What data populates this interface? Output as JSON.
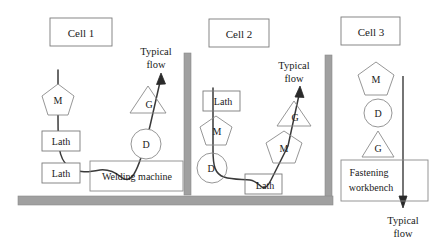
{
  "figure": {
    "type": "manufacturing-cell-layout-diagram",
    "walls": [
      {
        "name": "partition-wall-1",
        "orientation": "vertical",
        "x": 184,
        "y": 53,
        "w": 7,
        "h": 142
      },
      {
        "name": "partition-wall-2",
        "orientation": "vertical",
        "x": 325,
        "y": 55,
        "w": 7,
        "h": 145
      },
      {
        "name": "floor-wall",
        "orientation": "horizontal",
        "x": 18,
        "y": 196,
        "w": 315,
        "h": 9
      }
    ],
    "wall_color": "#9d9d9d",
    "line_color": "#3a3a3a",
    "box_border_color": "#7a7a7a"
  },
  "cells": [
    {
      "id": "cell-1",
      "label": "Cell 1",
      "label_box": {
        "x": 50,
        "y": 18,
        "w": 62,
        "h": 28
      },
      "flow_label": "Typical\nflow",
      "flow_label_lines": [
        "Typical",
        "flow"
      ],
      "machines": [
        {
          "name": "lath-1",
          "shape": "rect",
          "label": "Lath",
          "x": 42,
          "y": 131,
          "w": 38,
          "h": 20
        },
        {
          "name": "lath-2",
          "shape": "rect",
          "label": "Lath",
          "x": 42,
          "y": 163,
          "w": 38,
          "h": 20
        },
        {
          "name": "welding-machine",
          "shape": "rect",
          "label": "Welding machine",
          "x": 90,
          "y": 161,
          "w": 93,
          "h": 30
        },
        {
          "name": "mill-m",
          "shape": "pentagon",
          "label": "M",
          "cx": 58,
          "cy": 100,
          "r": 16
        },
        {
          "name": "drill-d",
          "shape": "circle",
          "label": "D",
          "cx": 146,
          "cy": 144,
          "r": 15
        },
        {
          "name": "grinder-g",
          "shape": "triangle",
          "label": "G",
          "cx": 148,
          "cy": 100,
          "r": 18
        }
      ]
    },
    {
      "id": "cell-2",
      "label": "Cell 2",
      "label_box": {
        "x": 209,
        "y": 19,
        "w": 60,
        "h": 28
      },
      "flow_label_lines": [
        "Typical",
        "flow"
      ],
      "machines": [
        {
          "name": "lath-1",
          "shape": "rect",
          "label": "Lath",
          "x": 203,
          "y": 91,
          "w": 37,
          "h": 20
        },
        {
          "name": "lath-2",
          "shape": "rect",
          "label": "Lath",
          "x": 245,
          "y": 174,
          "w": 37,
          "h": 20
        },
        {
          "name": "mill-m-1",
          "shape": "pentagon",
          "label": "M",
          "cx": 216,
          "cy": 131,
          "r": 16
        },
        {
          "name": "mill-m-2",
          "shape": "pentagon",
          "label": "M",
          "cx": 284,
          "cy": 148,
          "r": 18
        },
        {
          "name": "drill-d",
          "shape": "circle",
          "label": "D",
          "cx": 213,
          "cy": 168,
          "r": 15
        },
        {
          "name": "grinder-g",
          "shape": "triangle",
          "label": "G",
          "cx": 294,
          "cy": 114,
          "r": 17
        }
      ]
    },
    {
      "id": "cell-3",
      "label": "Cell 3",
      "label_box": {
        "x": 341,
        "y": 17,
        "w": 59,
        "h": 28
      },
      "flow_label_lines": [
        "Typical",
        "flow"
      ],
      "machines": [
        {
          "name": "mill-m",
          "shape": "pentagon",
          "label": "M",
          "cx": 376,
          "cy": 80,
          "r": 18
        },
        {
          "name": "drill-d",
          "shape": "circle",
          "label": "D",
          "cx": 379,
          "cy": 113,
          "r": 14
        },
        {
          "name": "grinder-g",
          "shape": "triangle",
          "label": "G",
          "cx": 378,
          "cy": 145,
          "r": 16
        },
        {
          "name": "fastening-workbench",
          "shape": "rect",
          "label_lines": [
            "Fastening",
            "workbench"
          ],
          "x": 341,
          "y": 160,
          "w": 87,
          "h": 41
        }
      ]
    }
  ],
  "labels": {
    "cell1_title": "Cell 1",
    "cell2_title": "Cell 2",
    "cell3_title": "Cell 3",
    "lath": "Lath",
    "welding_machine": "Welding machine",
    "fastening_line1": "Fastening",
    "fastening_line2": "workbench",
    "mill": "M",
    "drill": "D",
    "grinder": "G",
    "typical": "Typical",
    "flow": "flow"
  }
}
